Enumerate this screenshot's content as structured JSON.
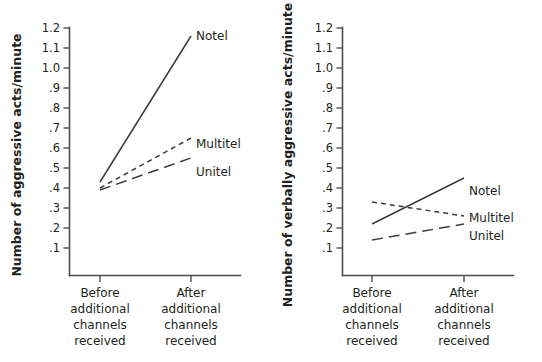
{
  "figure": {
    "panels": [
      {
        "id": "physical-aggression",
        "ylabel": "Number of aggressive acts/minute",
        "ylabel_icon": "y-axis-label"
      },
      {
        "id": "verbal-aggression",
        "ylabel": "Number of verbally aggressive acts/minute",
        "ylabel_icon": "y-axis-label"
      }
    ],
    "categories": [
      {
        "line1": "Before",
        "line2": "additional",
        "line3": "channels",
        "line4": "received"
      },
      {
        "line1": "After",
        "line2": "additional",
        "line3": "channels",
        "line4": "received"
      }
    ],
    "yticks": [
      "1.2",
      "1.1",
      "1.0",
      ".9",
      ".8",
      ".7",
      ".6",
      ".5",
      ".4",
      ".3",
      ".2",
      ".1"
    ],
    "series_labels": {
      "notel": "Notel",
      "multitel": "Multitel",
      "unitel": "Unitel"
    },
    "colors": {
      "ink": "#231f20",
      "axis": "#4d4d4f",
      "line": "#3c3b3d",
      "background": "#ffffff"
    }
  },
  "chart_data": [
    {
      "type": "line",
      "title": "",
      "xlabel": "",
      "ylabel": "Number of aggressive acts/minute",
      "categories": [
        "Before additional channels received",
        "After additional channels received"
      ],
      "x": [
        "Before",
        "After"
      ],
      "ylim": [
        0.0,
        1.2
      ],
      "ytick_values": [
        1.2,
        1.1,
        1.0,
        0.9,
        0.8,
        0.7,
        0.6,
        0.5,
        0.4,
        0.3,
        0.2,
        0.1
      ],
      "grid": false,
      "legend": "inline-right-of-line-ends",
      "series": [
        {
          "name": "Notel",
          "values": [
            0.43,
            1.16
          ],
          "style": "solid"
        },
        {
          "name": "Multitel",
          "values": [
            0.4,
            0.65
          ],
          "style": "dashed"
        },
        {
          "name": "Unitel",
          "values": [
            0.39,
            0.55
          ],
          "style": "long-dash"
        }
      ]
    },
    {
      "type": "line",
      "title": "",
      "xlabel": "",
      "ylabel": "Number of verbally aggressive acts/minute",
      "categories": [
        "Before additional channels received",
        "After additional channels received"
      ],
      "x": [
        "Before",
        "After"
      ],
      "ylim": [
        0.0,
        1.2
      ],
      "ytick_values": [
        1.2,
        1.1,
        1.0,
        0.9,
        0.8,
        0.7,
        0.6,
        0.5,
        0.4,
        0.3,
        0.2,
        0.1
      ],
      "grid": false,
      "legend": "inline-right-of-line-ends",
      "series": [
        {
          "name": "Notel",
          "values": [
            0.22,
            0.45
          ],
          "style": "solid"
        },
        {
          "name": "Multitel",
          "values": [
            0.33,
            0.26
          ],
          "style": "dashed"
        },
        {
          "name": "Unitel",
          "values": [
            0.14,
            0.22
          ],
          "style": "long-dash"
        }
      ]
    }
  ]
}
